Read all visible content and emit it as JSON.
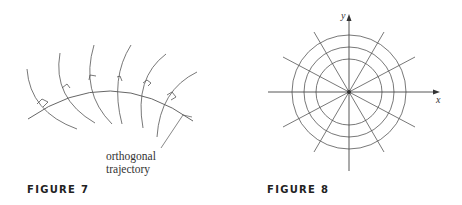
{
  "figures": [
    {
      "caption": "FIGURE 7",
      "annotation_line1": "orthogonal",
      "annotation_line2": "trajectory",
      "description": "Family of curves (arcs) crossed at right angles by an orthogonal trajectory arc; right-angle markers at each intersection"
    },
    {
      "caption": "FIGURE 8",
      "x_label": "x",
      "y_label": "y",
      "description": "Concentric circles centered at origin with straight lines through origin (orthogonal families)",
      "circle_count": 3,
      "radial_line_count": 6
    }
  ],
  "colors": {
    "line": "#555555",
    "text": "#333333",
    "caption": "#222222"
  }
}
